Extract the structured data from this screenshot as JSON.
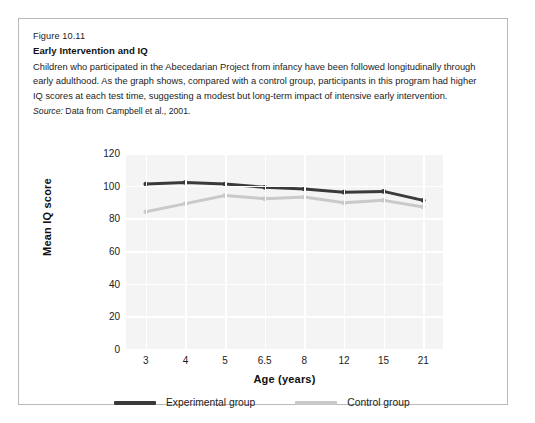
{
  "figure": {
    "number": "Figure 10.11",
    "title": "Early Intervention and IQ",
    "body": "Children who participated in the Abecedarian Project from infancy have been followed longitudinally through early adulthood. As the graph shows, compared with a control group, participants in this program had higher IQ scores at each test time, suggesting a modest but long-term impact of intensive early intervention.",
    "source_label": "Source:",
    "source_text": " Data from Campbell et al., 2001."
  },
  "chart_data": {
    "type": "line",
    "title": "",
    "xlabel": "Age (years)",
    "ylabel": "Mean IQ score",
    "categories": [
      "3",
      "4",
      "5",
      "6.5",
      "8",
      "12",
      "15",
      "21"
    ],
    "ylim": [
      0,
      120
    ],
    "yticks": [
      "120",
      "100",
      "80",
      "60",
      "40",
      "20",
      "0"
    ],
    "grid": true,
    "legend_position": "bottom",
    "series": [
      {
        "name": "Experimental group",
        "color": "#3a3a3a",
        "values": [
          101,
          102,
          101,
          99,
          98,
          96,
          96.5,
          91
        ]
      },
      {
        "name": "Control group",
        "color": "#c9c9c9",
        "values": [
          84,
          89,
          94,
          92,
          93,
          89.5,
          91,
          87
        ]
      }
    ]
  }
}
